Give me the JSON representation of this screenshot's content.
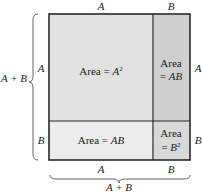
{
  "diagram": {
    "top_labels": [
      "A",
      "B"
    ],
    "bottom_labels": [
      "A",
      "B"
    ],
    "bottom_total": "A + B",
    "left_labels": [
      "A",
      "B"
    ],
    "left_total": "A + B",
    "right_labels": [
      "A",
      "B"
    ],
    "regions": {
      "top_left": {
        "line1_prefix": "Area = ",
        "var": "A",
        "sup": "2"
      },
      "top_right": {
        "line1": "Area",
        "line2_prefix": "= ",
        "var": "AB"
      },
      "bottom_left": {
        "line1_prefix": "Area = ",
        "var": "AB"
      },
      "bottom_right": {
        "line1": "Area",
        "line2_prefix": "= ",
        "var": "B",
        "sup": "2"
      }
    },
    "colors": {
      "top_left": "#e2e2e2",
      "top_right": "#cfcfcf",
      "bottom_left": "#ececec",
      "bottom_right": "#d9d9d9",
      "stroke": "#2a2a2a"
    }
  }
}
